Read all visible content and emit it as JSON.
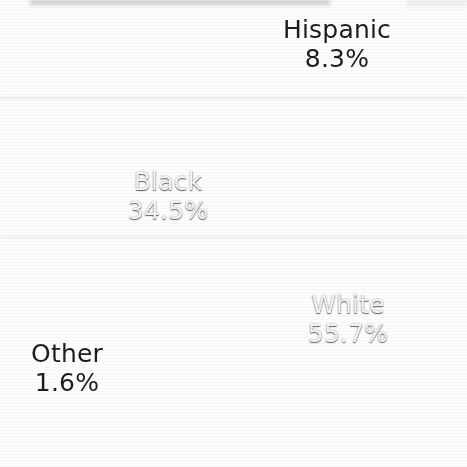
{
  "chart_data": {
    "type": "pie",
    "title": "",
    "categories": [
      "White",
      "Black",
      "Hispanic",
      "Other"
    ],
    "values": [
      55.7,
      34.5,
      8.3,
      1.6
    ],
    "value_unit": "%",
    "labels": [
      {
        "name": "Hispanic",
        "value_text": "8.3%",
        "value": 8.3,
        "placement": "outside",
        "text_color": "#1d1d1d",
        "slice_color": "#828282",
        "exploded": true
      },
      {
        "name": "Black",
        "value_text": "34.5%",
        "value": 34.5,
        "placement": "inside",
        "text_color": "#f4f4f4",
        "slice_color": "#454545",
        "exploded": false
      },
      {
        "name": "White",
        "value_text": "55.7%",
        "value": 55.7,
        "placement": "inside",
        "text_color": "#f4f4f4",
        "slice_color": "#8a8a8a",
        "exploded": false
      },
      {
        "name": "Other",
        "value_text": "1.6%",
        "value": 1.6,
        "placement": "outside",
        "text_color": "#1d1d1d",
        "slice_color": "#9a9a9a",
        "exploded": true
      }
    ],
    "legend": "none",
    "grid": false,
    "colors": {
      "white_slice": "#8a8a8a",
      "black_slice": "#454545",
      "hispanic_slice": "#828282",
      "other_slice": "#9a9a9a",
      "background": "#fdfdfd",
      "separator": "#ffffff"
    }
  }
}
